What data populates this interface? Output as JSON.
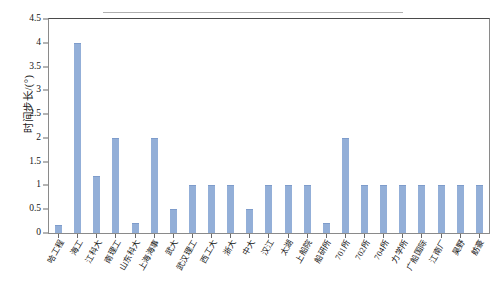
{
  "chart_data": {
    "type": "bar",
    "title": "",
    "subtitle": "",
    "xlabel": "",
    "ylabel": "时间步长/(°)",
    "ylim": [
      0,
      4.5
    ],
    "yticks": [
      "0",
      "0.5",
      "1",
      "1.5",
      "2",
      "2.5",
      "3",
      "3.5",
      "4",
      "4.5"
    ],
    "ytick_values": [
      0,
      0.5,
      1,
      1.5,
      2,
      2.5,
      3,
      3.5,
      4,
      4.5
    ],
    "grid": false,
    "legend": null,
    "legend_position": "none",
    "bar_color": "#93AFD8",
    "categories": [
      "哈工程",
      "海工",
      "江科大",
      "南理工",
      "山东科大",
      "上海海事",
      "武大",
      "武汉理工",
      "西工大",
      "浙大",
      "中大",
      "汉江",
      "太湖",
      "上船院",
      "船研所",
      "701所",
      "702所",
      "704所",
      "力学所",
      "广船国际",
      "江南厂",
      "昊野",
      "舫豪"
    ],
    "values": [
      0.17,
      4.0,
      1.2,
      2.0,
      0.22,
      2.0,
      0.5,
      1.0,
      1.0,
      1.0,
      0.5,
      1.0,
      1.0,
      1.0,
      0.22,
      2.0,
      1.0,
      1.0,
      1.0,
      1.0,
      1.0,
      1.0,
      1.0
    ]
  }
}
